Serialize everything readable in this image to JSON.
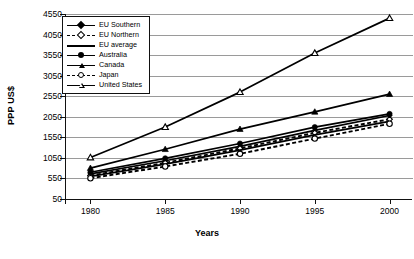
{
  "chart_data": {
    "type": "line",
    "title": "",
    "xlabel": "Years",
    "ylabel": "PPP US$",
    "x": [
      1980,
      1985,
      1990,
      1995,
      2000
    ],
    "xticklabels": [
      "1980",
      "1985",
      "1990",
      "1995",
      "2000"
    ],
    "yticks": [
      50,
      550,
      1050,
      1550,
      2050,
      2550,
      3050,
      3550,
      4050,
      4550
    ],
    "yticklabels": [
      "50",
      "550",
      "1050",
      "1550",
      "2050",
      "2550",
      "3050",
      "3550",
      "4050",
      "4550"
    ],
    "ylim": [
      50,
      4550
    ],
    "xlim": [
      1978.3,
      2001.5
    ],
    "grid": true,
    "grid_axis": "y",
    "legend_position": "upper-left-inside",
    "series": [
      {
        "name": "EU Southern",
        "marker": "diamond-filled",
        "line": "solid",
        "values": [
          660,
          980,
          1330,
          1720,
          2080
        ]
      },
      {
        "name": "EU Northern",
        "marker": "diamond-open",
        "line": "dashed",
        "values": [
          620,
          930,
          1280,
          1660,
          1990
        ]
      },
      {
        "name": "EU average",
        "marker": "none",
        "line": "solid",
        "values": [
          600,
          900,
          1240,
          1610,
          1940
        ]
      },
      {
        "name": "Australia",
        "marker": "circle-filled",
        "line": "solid",
        "values": [
          700,
          1040,
          1400,
          1800,
          2120
        ]
      },
      {
        "name": "Canada",
        "marker": "triangle-filled",
        "line": "solid",
        "values": [
          800,
          1260,
          1750,
          2170,
          2600
        ]
      },
      {
        "name": "Japan",
        "marker": "circle-open",
        "line": "dashed",
        "values": [
          555,
          840,
          1150,
          1520,
          1880
        ]
      },
      {
        "name": "United States",
        "marker": "triangle-open",
        "line": "solid",
        "values": [
          1060,
          1800,
          2650,
          3600,
          4450
        ]
      }
    ],
    "colors": {
      "line": "#000000",
      "grid": "#9a9a9a",
      "axis": "#111111",
      "background": "#ffffff"
    }
  }
}
